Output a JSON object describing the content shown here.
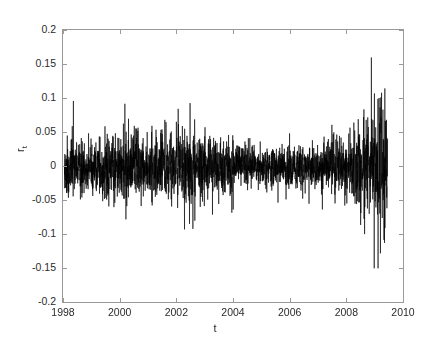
{
  "chart_data": {
    "type": "line",
    "title": "",
    "subtitle": "",
    "xlabel": "t",
    "ylabel": "r_t",
    "ylabel_base": "r",
    "ylabel_sub": "t",
    "xlim": [
      1998,
      2010
    ],
    "ylim": [
      -0.2,
      0.2
    ],
    "xticks": [
      1998,
      2000,
      2002,
      2004,
      2006,
      2008,
      2010
    ],
    "xtick_labels": [
      "1998",
      "2000",
      "2002",
      "2004",
      "2006",
      "2008",
      "2010"
    ],
    "yticks": [
      -0.2,
      -0.15,
      -0.1,
      -0.05,
      0,
      0.05,
      0.1,
      0.15,
      0.2
    ],
    "ytick_labels": [
      "0.2",
      "0.15",
      "0.1",
      "0.05",
      "0",
      "-0.05",
      "-0.1",
      "-0.15",
      "-0.2"
    ],
    "grid": false,
    "legend": null,
    "legend_position": "none",
    "series": [
      {
        "name": "r_t",
        "color": "#000000",
        "line_width": 0.6,
        "description": "Daily log returns series exhibiting volatility clustering; near-zero mean with time-varying amplitude.",
        "x_start": 1998.0,
        "x_end": 2009.42,
        "n_points": 2860,
        "observed_max": 0.161,
        "observed_min": -0.149,
        "mean": 0.0,
        "typical_band": [
          -0.035,
          0.035
        ],
        "notable_events": [
          {
            "x": 2000.15,
            "y": 0.093,
            "label": "spike up"
          },
          {
            "x": 2000.55,
            "y": 0.056,
            "label": "spike up"
          },
          {
            "x": 2002.45,
            "y": 0.094,
            "label": "spike up"
          },
          {
            "x": 2002.55,
            "y": -0.091,
            "label": "spike down"
          },
          {
            "x": 2001.6,
            "y": 0.066,
            "label": "spike up"
          },
          {
            "x": 2008.85,
            "y": 0.161,
            "label": "crisis peak up"
          },
          {
            "x": 2008.95,
            "y": -0.149,
            "label": "crisis peak down"
          }
        ],
        "volatility_regimes": [
          {
            "start": 1998.0,
            "end": 2000.5,
            "sigma": 0.0155,
            "label": "moderate-high"
          },
          {
            "start": 2000.5,
            "end": 2003.2,
            "sigma": 0.017,
            "label": "high"
          },
          {
            "start": 2003.2,
            "end": 2007.3,
            "sigma": 0.0095,
            "label": "calm"
          },
          {
            "start": 2007.3,
            "end": 2008.6,
            "sigma": 0.0145,
            "label": "rising"
          },
          {
            "start": 2008.6,
            "end": 2009.42,
            "sigma": 0.033,
            "label": "crisis"
          }
        ]
      }
    ],
    "axis_color": "#9a9a9a",
    "background": "#ffffff",
    "tick_direction": "in"
  },
  "axes": {
    "x_axis_name": "time-axis",
    "y_axis_name": "returns-axis"
  }
}
